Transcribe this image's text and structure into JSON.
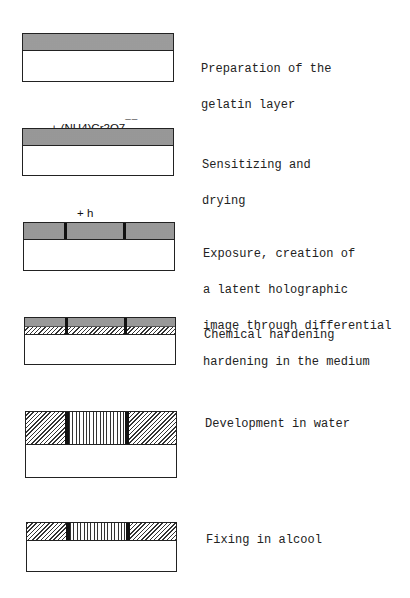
{
  "diagram": {
    "colors": {
      "line": "#222222",
      "dotted_fill": "#d8d8d8",
      "background": "#ffffff"
    },
    "steps": [
      {
        "id": 1,
        "reagent": "",
        "caption_lines": [
          "Preparation of the",
          "gelatin layer"
        ],
        "layer_pattern": "dotted"
      },
      {
        "id": 2,
        "reagent": "+ (NH4)Cr2O7",
        "reagent_charge": "¯¯",
        "caption_lines": [
          "Sensitizing and",
          "drying"
        ],
        "layer_pattern": "dotted"
      },
      {
        "id": 3,
        "reagent": "+ h",
        "caption_lines": [
          "Exposure, creation of",
          "a latent holographic",
          "image through differential",
          "hardening in the medium"
        ],
        "layer_pattern": "dotted-with-exposed-bars"
      },
      {
        "id": 4,
        "reagent": "",
        "caption_lines": [
          "Chemical hardening"
        ],
        "layer_pattern": "dotted-over-hatched-with-bars"
      },
      {
        "id": 5,
        "reagent": "",
        "caption_lines": [
          "Development in water"
        ],
        "layer_pattern": "hatched-swollen-with-vertical-stripes"
      },
      {
        "id": 6,
        "reagent": "",
        "caption_lines": [
          "Fixing in alcool"
        ],
        "layer_pattern": "hatched-with-vertical-stripes"
      }
    ]
  }
}
